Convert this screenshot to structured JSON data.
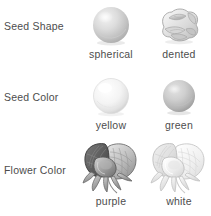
{
  "figure": {
    "background_color": "#ffffff",
    "text_color": "#4d4d4d"
  },
  "traits": [
    {
      "label": "Seed Shape",
      "variants": [
        {
          "name": "spherical",
          "art": "round-seed-icon"
        },
        {
          "name": "dented",
          "art": "wrinkled-seed-icon"
        }
      ]
    },
    {
      "label": "Seed Color",
      "variants": [
        {
          "name": "yellow",
          "art": "pale-seed-icon"
        },
        {
          "name": "green",
          "art": "dark-seed-icon"
        }
      ]
    },
    {
      "label": "Flower Color",
      "variants": [
        {
          "name": "purple",
          "art": "dark-flower-icon"
        },
        {
          "name": "white",
          "art": "pale-flower-icon"
        }
      ]
    }
  ]
}
